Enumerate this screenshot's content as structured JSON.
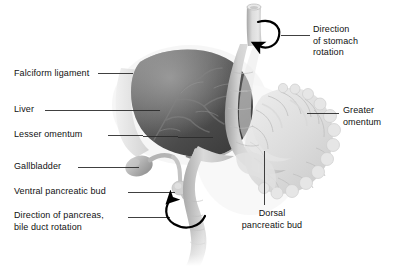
{
  "figure": {
    "background_color": "#ffffff",
    "text_color": "#111111",
    "leader_color": "#2b2b2b",
    "arrow_color": "#000000"
  },
  "palette": {
    "liver_dark": "#3f3f3f",
    "liver_mid": "#6f6f6f",
    "liver_light": "#9a9a9a",
    "stomach_light": "#d8d8d8",
    "stomach_mid": "#b4b4b4",
    "omentum_light": "#e3e3e3",
    "omentum_mid": "#cfcfcf",
    "duct_gray": "#c6c6c6",
    "halo": "#ececec"
  },
  "labels": [
    {
      "id": "falciform-ligament",
      "text": "Falciform ligament",
      "x": 14,
      "y": 68,
      "align": "left"
    },
    {
      "id": "liver",
      "text": "Liver",
      "x": 14,
      "y": 106,
      "align": "left"
    },
    {
      "id": "lesser-omentum",
      "text": "Lesser omentum",
      "x": 14,
      "y": 131,
      "align": "left"
    },
    {
      "id": "gallbladder",
      "text": "Gallbladder",
      "x": 14,
      "y": 163,
      "align": "left"
    },
    {
      "id": "ventral-pancreatic-bud",
      "text": "Ventral pancreatic bud",
      "x": 14,
      "y": 188,
      "align": "left"
    },
    {
      "id": "direction-of-pancreas-bile-duct-rotation",
      "text": "Direction of pancreas,\nbile duct rotation",
      "x": 14,
      "y": 212,
      "align": "left"
    },
    {
      "id": "direction-of-stomach-rotation",
      "text": "Direction\nof stomach\nrotation",
      "x": 313,
      "y": 26,
      "align": "left"
    },
    {
      "id": "greater-omentum",
      "text": "Greater\nomentum",
      "x": 343,
      "y": 106,
      "align": "left"
    },
    {
      "id": "dorsal-pancreatic-bud",
      "text": "Dorsal\npancreatic bud",
      "x": 232,
      "y": 210,
      "align": "left"
    }
  ],
  "annotations": {
    "stomach_rotation_arrow": "counterclockwise-curved-arrow",
    "pancreas_rotation_arrow": "clockwise-curved-arrow"
  },
  "structures": [
    {
      "id": "liver",
      "name": "Liver"
    },
    {
      "id": "falciform-ligament",
      "name": "Falciform ligament"
    },
    {
      "id": "lesser-omentum",
      "name": "Lesser omentum"
    },
    {
      "id": "gallbladder",
      "name": "Gallbladder"
    },
    {
      "id": "ventral-pancreatic-bud",
      "name": "Ventral pancreatic bud"
    },
    {
      "id": "dorsal-pancreatic-bud",
      "name": "Dorsal pancreatic bud"
    },
    {
      "id": "greater-omentum",
      "name": "Greater omentum"
    },
    {
      "id": "stomach",
      "name": "Stomach"
    },
    {
      "id": "esophagus",
      "name": "Esophagus"
    },
    {
      "id": "duodenum",
      "name": "Duodenum"
    }
  ]
}
